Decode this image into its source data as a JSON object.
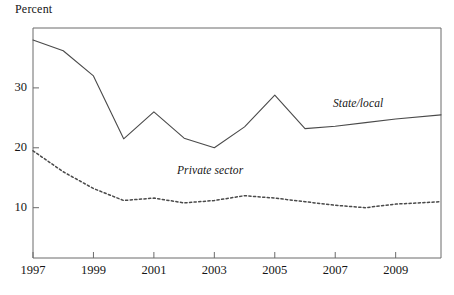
{
  "chart_data": {
    "type": "line",
    "title": "",
    "subtitle": "",
    "xlabel": "",
    "ylabel": "Percent",
    "xlim": [
      1997,
      2010.5
    ],
    "ylim": [
      1.6,
      40
    ],
    "grid": false,
    "legend_position": "inline-annotation",
    "xticks": [
      1997,
      1999,
      2001,
      2003,
      2005,
      2007,
      2009
    ],
    "xtick_labels": [
      "1997",
      "1999",
      "2001",
      "2003",
      "2005",
      "2007",
      "2009"
    ],
    "yticks": [
      10,
      20,
      30
    ],
    "ytick_labels": [
      "10",
      "20",
      "30"
    ],
    "series": [
      {
        "name": "State/local",
        "style": "solid",
        "color": "#4a4a4a",
        "label_text": "State/local",
        "x": [
          1997,
          1998,
          1999,
          2000,
          2001,
          2002,
          2003,
          2004,
          2005,
          2006,
          2007,
          2008,
          2009,
          2010.5
        ],
        "values": [
          38.0,
          36.2,
          32.0,
          21.5,
          26.0,
          21.6,
          20.0,
          23.5,
          28.8,
          23.2,
          23.6,
          24.2,
          24.8,
          25.5
        ]
      },
      {
        "name": "Private sector",
        "style": "dotted",
        "color": "#4a4a4a",
        "label_text": "Private sector",
        "x": [
          1997,
          1998,
          1999,
          2000,
          2001,
          2002,
          2003,
          2004,
          2005,
          2006,
          2007,
          2008,
          2009,
          2010.5
        ],
        "values": [
          19.5,
          16.0,
          13.2,
          11.2,
          11.6,
          10.8,
          11.2,
          12.0,
          11.6,
          11.0,
          10.4,
          10.0,
          10.6,
          11.0
        ]
      }
    ]
  },
  "axis": {
    "y_title": "Percent"
  },
  "frame": {
    "left": 33,
    "right": 441,
    "top": 28,
    "bottom": 258
  },
  "colors": {
    "line": "#4a4a4a",
    "frame": "#6b6b6b",
    "text": "#151515",
    "background": "#ffffff"
  }
}
